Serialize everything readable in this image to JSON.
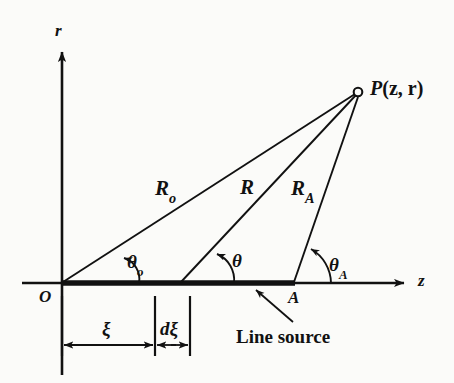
{
  "figure": {
    "background_color": "#fbfbf9",
    "ink_color": "#111111",
    "axes": {
      "vertical_label": "r",
      "horizontal_label": "z",
      "origin_label": "O"
    },
    "points": [
      {
        "name": "origin",
        "label": "O",
        "x": 62,
        "y": 283
      },
      {
        "name": "end-of-source",
        "label": "A",
        "x": 294,
        "y": 283
      },
      {
        "name": "field-point",
        "label": "P",
        "args": "(z, r)",
        "x": 358,
        "y": 92
      },
      {
        "name": "source-element",
        "label": "",
        "x": 180,
        "y": 283
      }
    ],
    "rays": [
      {
        "name": "R-sub-o",
        "label": "R",
        "subscript": "o",
        "label_x": 155,
        "label_y": 178,
        "from_x": 62,
        "from_y": 283,
        "to_x": 358,
        "to_y": 92
      },
      {
        "name": "R",
        "label": "R",
        "subscript": "",
        "label_x": 240,
        "label_y": 177,
        "from_x": 180,
        "from_y": 283,
        "to_x": 358,
        "to_y": 92
      },
      {
        "name": "R-sub-A",
        "label": "R",
        "subscript": "A",
        "label_x": 291,
        "label_y": 178,
        "from_x": 294,
        "from_y": 283,
        "to_x": 358,
        "to_y": 92
      }
    ],
    "angles": [
      {
        "name": "theta-sub-o",
        "label": "θ",
        "subscript": "o",
        "label_x": 127,
        "label_y": 252
      },
      {
        "name": "theta",
        "label": "θ",
        "subscript": "",
        "label_x": 232,
        "label_y": 251
      },
      {
        "name": "theta-sub-A",
        "label": "θ",
        "subscript": "A",
        "label_x": 329,
        "label_y": 255
      }
    ],
    "dimensions": [
      {
        "name": "xi",
        "label": "ξ",
        "label_x": 102,
        "label_y": 319,
        "from_x": 62,
        "to_x": 155
      },
      {
        "name": "d-xi",
        "label": "dξ",
        "label_x": 160,
        "label_y": 319,
        "from_x": 155,
        "to_x": 190
      }
    ],
    "annotation": {
      "name": "line-source",
      "label": "Line source",
      "label_x": 236,
      "label_y": 327,
      "leader_from_x": 293,
      "leader_from_y": 322,
      "leader_to_x": 254,
      "leader_to_y": 289
    }
  }
}
